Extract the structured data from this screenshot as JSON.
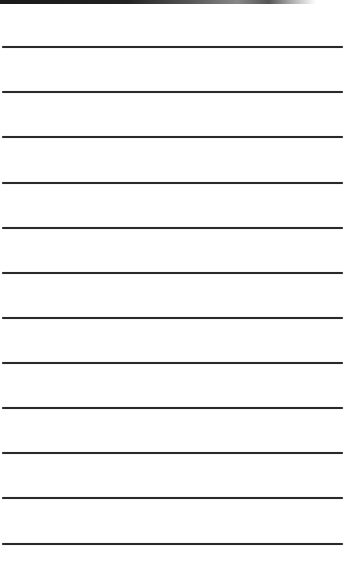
{
  "page": {
    "type": "lined-paper",
    "line_color": "#2a2a2a",
    "background": "#ffffff",
    "lines_y": [
      47,
      92,
      137,
      183,
      228,
      273,
      318,
      363,
      408,
      453,
      498,
      544
    ]
  }
}
